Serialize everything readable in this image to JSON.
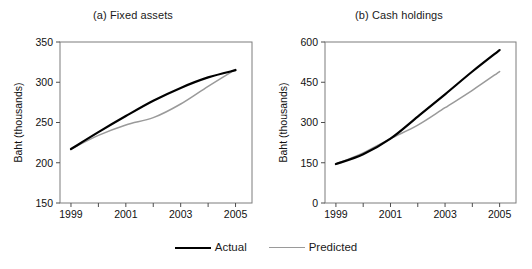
{
  "figure": {
    "legend": {
      "position": "bottom-center",
      "items": [
        {
          "label": "Actual",
          "color": "#000000",
          "style": "solid-thick"
        },
        {
          "label": "Predicted",
          "color": "#9a9a9a",
          "style": "solid-thin"
        }
      ]
    }
  },
  "chart_data": [
    {
      "type": "line",
      "title": "(a) Fixed assets",
      "xlabel": "",
      "ylabel": "Baht (thousands)",
      "x": [
        1999,
        2000,
        2001,
        2002,
        2003,
        2004,
        2005
      ],
      "xlim": [
        1998.6,
        2005.6
      ],
      "xticks": [
        1999,
        2001,
        2003,
        2005
      ],
      "xticklabels": [
        "1999",
        "2001",
        "2003",
        "2005"
      ],
      "ylim": [
        150,
        350
      ],
      "yticks": [
        150,
        200,
        250,
        300,
        350
      ],
      "yticklabels": [
        "150",
        "200",
        "250",
        "300",
        "350"
      ],
      "grid": false,
      "series": [
        {
          "name": "Actual",
          "color": "#000000",
          "values": [
            217,
            238,
            258,
            277,
            293,
            306,
            315
          ]
        },
        {
          "name": "Predicted",
          "color": "#9a9a9a",
          "values": [
            217,
            234,
            247,
            256,
            273,
            295,
            316
          ]
        }
      ]
    },
    {
      "type": "line",
      "title": "(b) Cash holdings",
      "xlabel": "",
      "ylabel": "Baht (thousands)",
      "x": [
        1999,
        2000,
        2001,
        2002,
        2003,
        2004,
        2005
      ],
      "xlim": [
        1998.6,
        2005.6
      ],
      "xticks": [
        1999,
        2001,
        2003,
        2005
      ],
      "xticklabels": [
        "1999",
        "2001",
        "2003",
        "2005"
      ],
      "ylim": [
        0,
        600
      ],
      "yticks": [
        0,
        150,
        300,
        450,
        600
      ],
      "yticklabels": [
        "0",
        "150",
        "300",
        "450",
        "600"
      ],
      "grid": false,
      "series": [
        {
          "name": "Actual",
          "color": "#000000",
          "values": [
            145,
            182,
            240,
            322,
            405,
            490,
            570
          ]
        },
        {
          "name": "Predicted",
          "color": "#9a9a9a",
          "values": [
            145,
            187,
            240,
            290,
            355,
            420,
            490
          ]
        }
      ]
    }
  ]
}
